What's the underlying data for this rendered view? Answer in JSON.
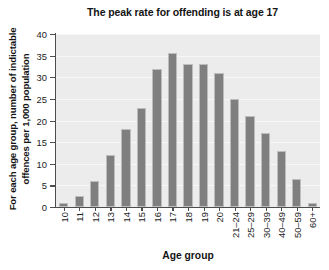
{
  "chart_data": {
    "type": "bar",
    "title": "The peak rate for offending is at age 17",
    "xlabel": "Age group",
    "ylabel": "For each age group, number of indictable offences per 1,000 population",
    "ylabel_lines": [
      "For each age group, number of indictable",
      "offences per 1,000 population"
    ],
    "categories": [
      "10",
      "11",
      "12",
      "13",
      "14",
      "15",
      "16",
      "17",
      "18",
      "19",
      "20",
      "21–24",
      "25–29",
      "30–39",
      "40–49",
      "50–59",
      "60+"
    ],
    "values": [
      1,
      2.5,
      6,
      12,
      18,
      23,
      32,
      35.5,
      33,
      33,
      31,
      25,
      21,
      17,
      13,
      6.5,
      1
    ],
    "ylim": [
      0,
      40
    ],
    "yticks": [
      0,
      5,
      10,
      15,
      20,
      25,
      30,
      35,
      40
    ],
    "ytick_labels": [
      "0",
      "5",
      "10",
      "15",
      "20",
      "25",
      "30",
      "35",
      "40"
    ],
    "grid": true,
    "legend": false,
    "bar_color": "#7f7f7f",
    "plot_background": "#ececec",
    "gridline_color": "#f7f7f7",
    "axis_color": "#4d4d4d"
  }
}
